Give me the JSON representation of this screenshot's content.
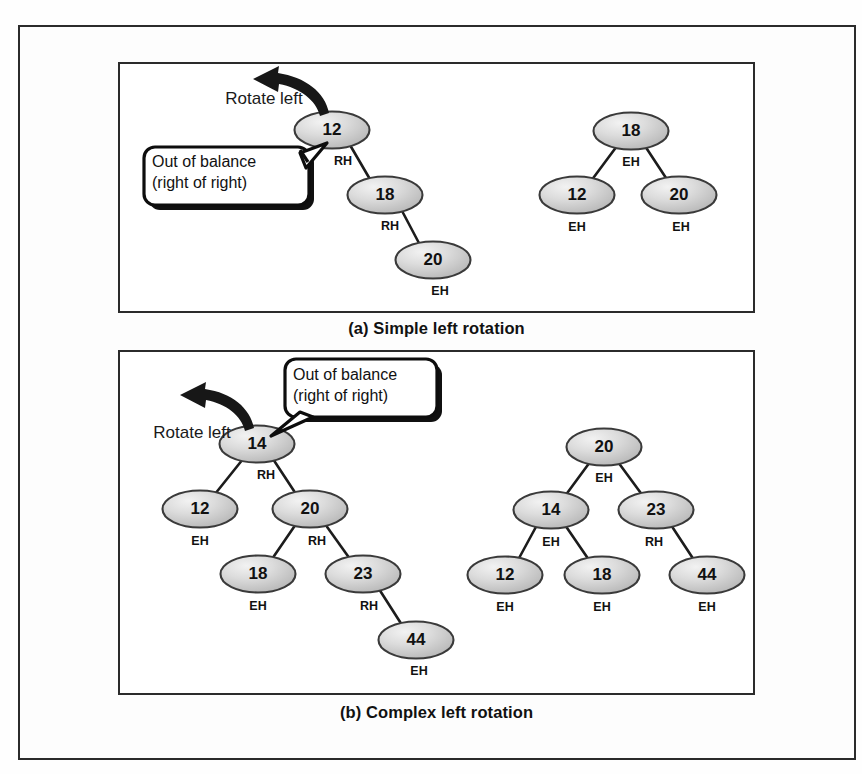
{
  "figure": {
    "title_a": "(a) Simple left rotation",
    "title_b": "(b) Complex left rotation",
    "colors": {
      "node_fill_light": "#e9e9e9",
      "node_fill_mid": "#c6c6c6",
      "node_stroke": "#3a3a3a",
      "line": "#1c1c1c",
      "frame": "#2b2b2b",
      "text": "#111111",
      "callout_shadow": "#101010"
    }
  },
  "annotations": {
    "rotate_left": "Rotate left",
    "out_of_balance_line1": "Out of balance",
    "out_of_balance_line2": "(right of right)"
  },
  "balance_factors": {
    "RH": "RH",
    "LH": "LH",
    "EH": "EH"
  },
  "panel_a": {
    "caption": "(a) Simple left rotation",
    "before": {
      "label": "Out of balance tree before simple left rotation",
      "nodes": [
        {
          "key": "12",
          "bf": "RH",
          "cx": 332,
          "cy": 130,
          "bf_x": 343,
          "bf_y": 165
        },
        {
          "key": "18",
          "bf": "RH",
          "cx": 385,
          "cy": 195,
          "bf_x": 390,
          "bf_y": 230
        },
        {
          "key": "20",
          "bf": "EH",
          "cx": 433,
          "cy": 260,
          "bf_x": 440,
          "bf_y": 295
        }
      ],
      "edges": [
        {
          "x1": 350,
          "y1": 145,
          "x2": 371,
          "y2": 181
        },
        {
          "x1": 401,
          "y1": 209,
          "x2": 420,
          "y2": 245
        }
      ]
    },
    "after": {
      "label": "Balanced tree after simple left rotation",
      "nodes": [
        {
          "key": "18",
          "bf": "EH",
          "cx": 631,
          "cy": 131,
          "bf_x": 631,
          "bf_y": 166
        },
        {
          "key": "12",
          "bf": "EH",
          "cx": 577,
          "cy": 195,
          "bf_x": 577,
          "bf_y": 231
        },
        {
          "key": "20",
          "bf": "EH",
          "cx": 679,
          "cy": 195,
          "bf_x": 681,
          "bf_y": 231
        }
      ],
      "edges": [
        {
          "x1": 617,
          "y1": 146,
          "x2": 591,
          "y2": 181
        },
        {
          "x1": 645,
          "y1": 146,
          "x2": 668,
          "y2": 181
        }
      ]
    }
  },
  "panel_b": {
    "caption": "(b) Complex left rotation",
    "before": {
      "label": "Out of balance tree before complex left rotation",
      "nodes": [
        {
          "key": "14",
          "bf": "RH",
          "cx": 257,
          "cy": 444,
          "bf_x": 266,
          "bf_y": 479
        },
        {
          "key": "12",
          "bf": "EH",
          "cx": 200,
          "cy": 509,
          "bf_x": 200,
          "bf_y": 545
        },
        {
          "key": "20",
          "bf": "RH",
          "cx": 310,
          "cy": 509,
          "bf_x": 317,
          "bf_y": 545
        },
        {
          "key": "18",
          "bf": "EH",
          "cx": 258,
          "cy": 574,
          "bf_x": 258,
          "bf_y": 610
        },
        {
          "key": "23",
          "bf": "RH",
          "cx": 363,
          "cy": 574,
          "bf_x": 369,
          "bf_y": 610
        },
        {
          "key": "44",
          "bf": "EH",
          "cx": 416,
          "cy": 640,
          "bf_x": 419,
          "bf_y": 675
        }
      ],
      "edges": [
        {
          "x1": 243,
          "y1": 459,
          "x2": 215,
          "y2": 494
        },
        {
          "x1": 273,
          "y1": 459,
          "x2": 296,
          "y2": 494
        },
        {
          "x1": 296,
          "y1": 524,
          "x2": 272,
          "y2": 559
        },
        {
          "x1": 325,
          "y1": 524,
          "x2": 350,
          "y2": 559
        },
        {
          "x1": 379,
          "y1": 589,
          "x2": 402,
          "y2": 625
        }
      ]
    },
    "after": {
      "label": "Balanced tree after complex left rotation",
      "nodes": [
        {
          "key": "20",
          "bf": "EH",
          "cx": 604,
          "cy": 447,
          "bf_x": 604,
          "bf_y": 482
        },
        {
          "key": "14",
          "bf": "EH",
          "cx": 551,
          "cy": 510,
          "bf_x": 551,
          "bf_y": 546
        },
        {
          "key": "23",
          "bf": "RH",
          "cx": 656,
          "cy": 510,
          "bf_x": 654,
          "bf_y": 546
        },
        {
          "key": "12",
          "bf": "EH",
          "cx": 505,
          "cy": 575,
          "bf_x": 505,
          "bf_y": 611
        },
        {
          "key": "18",
          "bf": "EH",
          "cx": 602,
          "cy": 575,
          "bf_x": 602,
          "bf_y": 611
        },
        {
          "key": "44",
          "bf": "EH",
          "cx": 707,
          "cy": 575,
          "bf_x": 707,
          "bf_y": 611
        }
      ],
      "edges": [
        {
          "x1": 590,
          "y1": 462,
          "x2": 565,
          "y2": 496
        },
        {
          "x1": 618,
          "y1": 462,
          "x2": 643,
          "y2": 496
        },
        {
          "x1": 537,
          "y1": 525,
          "x2": 518,
          "y2": 560
        },
        {
          "x1": 565,
          "y1": 525,
          "x2": 589,
          "y2": 560
        },
        {
          "x1": 671,
          "y1": 525,
          "x2": 694,
          "y2": 560
        }
      ]
    }
  }
}
